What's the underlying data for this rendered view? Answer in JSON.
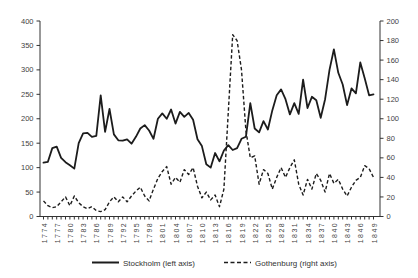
{
  "figure": {
    "background": "#ffffff",
    "series_line_color": "#1c1c1c",
    "axis_color": "#333333",
    "tick_label_color": "#3f3f3f"
  },
  "legend": {
    "stockholm_label": "Stockholm (left axis)",
    "gothenburg_label": "Gothenburg (right axis)"
  },
  "chart_data": {
    "type": "line",
    "title": "",
    "xlabel": "",
    "ylabel_left": "",
    "ylabel_right": "",
    "grid": false,
    "legend_position": "bottom",
    "x": [
      1774,
      1775,
      1776,
      1777,
      1778,
      1779,
      1780,
      1781,
      1782,
      1783,
      1784,
      1785,
      1786,
      1787,
      1788,
      1789,
      1790,
      1791,
      1792,
      1793,
      1794,
      1795,
      1796,
      1797,
      1798,
      1799,
      1800,
      1801,
      1802,
      1803,
      1804,
      1805,
      1806,
      1807,
      1808,
      1809,
      1810,
      1811,
      1812,
      1813,
      1814,
      1815,
      1816,
      1817,
      1818,
      1819,
      1820,
      1821,
      1822,
      1823,
      1824,
      1825,
      1826,
      1827,
      1828,
      1829,
      1830,
      1831,
      1832,
      1833,
      1834,
      1835,
      1836,
      1837,
      1838,
      1839,
      1840,
      1841,
      1842,
      1843,
      1844,
      1845,
      1846,
      1847,
      1848,
      1849
    ],
    "x_tick_labels": [
      1774,
      1777,
      1780,
      1783,
      1786,
      1789,
      1792,
      1795,
      1798,
      1801,
      1804,
      1807,
      1810,
      1813,
      1816,
      1819,
      1822,
      1825,
      1828,
      1831,
      1834,
      1837,
      1840,
      1843,
      1846,
      1849
    ],
    "left_axis": {
      "min": 0,
      "max": 400,
      "step": 50,
      "ticks": [
        0,
        50,
        100,
        150,
        200,
        250,
        300,
        350,
        400
      ]
    },
    "right_axis": {
      "min": 0,
      "max": 200,
      "step": 20,
      "ticks": [
        0,
        20,
        40,
        60,
        80,
        100,
        120,
        140,
        160,
        180,
        200
      ]
    },
    "series": [
      {
        "name": "Stockholm (left axis)",
        "axis": "left",
        "style": "solid",
        "values": [
          110,
          112,
          140,
          143,
          120,
          111,
          105,
          98,
          150,
          170,
          171,
          163,
          165,
          248,
          173,
          220,
          168,
          156,
          155,
          158,
          149,
          163,
          180,
          187,
          176,
          159,
          200,
          211,
          200,
          219,
          190,
          214,
          204,
          212,
          198,
          158,
          144,
          107,
          100,
          130,
          113,
          135,
          146,
          136,
          140,
          159,
          163,
          232,
          180,
          172,
          195,
          178,
          217,
          248,
          260,
          240,
          209,
          232,
          210,
          280,
          222,
          245,
          238,
          202,
          240,
          300,
          342,
          294,
          270,
          228,
          262,
          252,
          315,
          283,
          248,
          250
        ]
      },
      {
        "name": "Gothenburg (right axis)",
        "axis": "right",
        "style": "dashed",
        "values": [
          16,
          11,
          9,
          10,
          15,
          20,
          11,
          21,
          14,
          10,
          8,
          10,
          6,
          5,
          7,
          15,
          20,
          15,
          20,
          15,
          21,
          26,
          30,
          21,
          16,
          28,
          39,
          46,
          51,
          33,
          40,
          35,
          48,
          43,
          50,
          31,
          19,
          25,
          17,
          22,
          10,
          28,
          107,
          186,
          180,
          150,
          88,
          60,
          62,
          33,
          48,
          44,
          28,
          40,
          50,
          40,
          50,
          58,
          33,
          22,
          38,
          28,
          44,
          37,
          25,
          44,
          34,
          38,
          28,
          21,
          30,
          37,
          40,
          52,
          49,
          40
        ]
      }
    ]
  }
}
